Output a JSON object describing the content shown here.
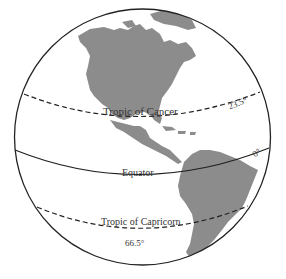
{
  "diagram": {
    "colors": {
      "land": "#8c8c8c",
      "outline": "#222222",
      "text": "#333333",
      "background": "#ffffff"
    },
    "lines": [
      {
        "id": "tropic-of-cancer",
        "label": "Tropic of Cancer",
        "degree": "23.5°",
        "style": "dashed"
      },
      {
        "id": "equator",
        "label": "Equator",
        "degree": "0°",
        "style": "solid"
      },
      {
        "id": "tropic-of-capricorn",
        "label": "Tropic of Capricorn",
        "degree": "66.5°",
        "style": "dashed"
      }
    ],
    "landmasses": [
      "North America",
      "Greenland",
      "Central America",
      "Caribbean Islands",
      "South America"
    ]
  }
}
